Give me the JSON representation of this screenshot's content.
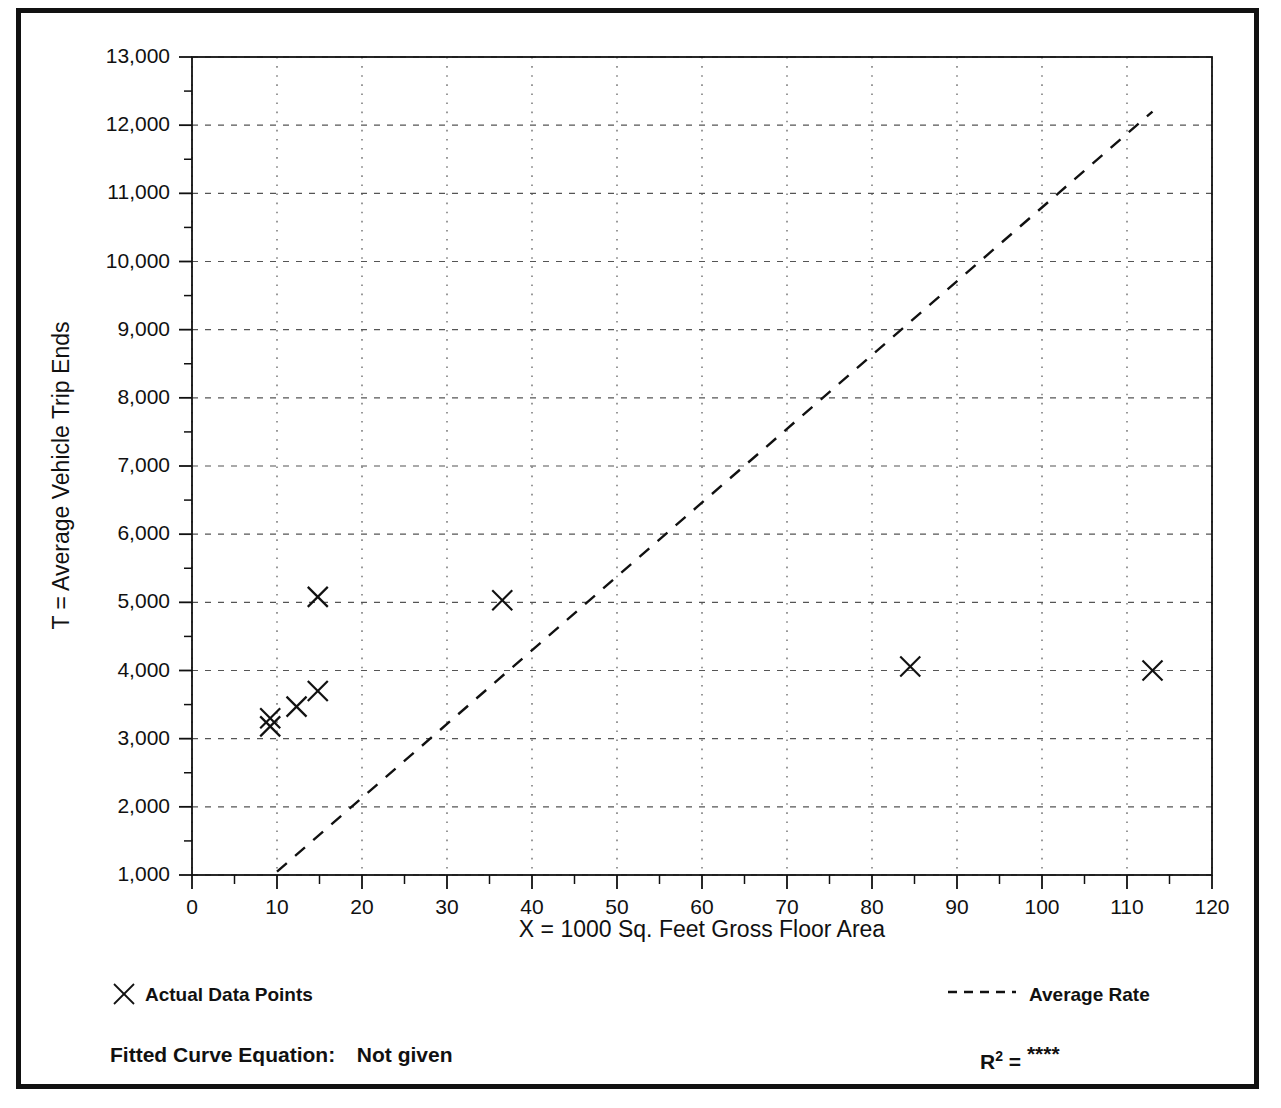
{
  "chart_data": {
    "type": "scatter",
    "title": "",
    "xlabel": "X = 1000 Sq. Feet Gross Floor Area",
    "ylabel": "T = Average Vehicle Trip Ends",
    "xlim": [
      0,
      120
    ],
    "ylim": [
      1000,
      13000
    ],
    "xticks": [
      0,
      10,
      20,
      30,
      40,
      50,
      60,
      70,
      80,
      90,
      100,
      110,
      120
    ],
    "xtick_labels": [
      "0",
      "10",
      "20",
      "30",
      "40",
      "50",
      "60",
      "70",
      "80",
      "90",
      "100",
      "110",
      "120"
    ],
    "xminor_step": 5,
    "yticks": [
      1000,
      2000,
      3000,
      4000,
      5000,
      6000,
      7000,
      8000,
      9000,
      10000,
      11000,
      12000,
      13000
    ],
    "ytick_labels": [
      "1,000",
      "2,000",
      "3,000",
      "4,000",
      "5,000",
      "6,000",
      "7,000",
      "8,000",
      "9,000",
      "10,000",
      "11,000",
      "12,000",
      "13,000"
    ],
    "yminor_step": 500,
    "grid": true,
    "grid_style": "dotted",
    "grid_color": "#555555",
    "legend_position": "below-axes",
    "series": [
      {
        "name": "Actual Data Points",
        "type": "scatter",
        "marker": "x",
        "color": "#111111",
        "points": [
          {
            "x": 9.2,
            "y": 3300
          },
          {
            "x": 9.2,
            "y": 3180
          },
          {
            "x": 12.3,
            "y": 3470
          },
          {
            "x": 14.8,
            "y": 3700
          },
          {
            "x": 14.8,
            "y": 5080
          },
          {
            "x": 36.5,
            "y": 5030
          },
          {
            "x": 84.5,
            "y": 4060
          },
          {
            "x": 113.0,
            "y": 4000
          }
        ]
      },
      {
        "name": "Average Rate",
        "type": "line",
        "style": "dashed",
        "color": "#111111",
        "x": [
          10.0,
          113.0
        ],
        "y": [
          1050,
          12200
        ]
      }
    ]
  },
  "legend": {
    "points_label": "Actual Data Points",
    "line_label": "Average Rate",
    "points_marker_icon": "x-marker-icon",
    "line_marker_icon": "dashed-line-icon"
  },
  "annotations": {
    "fitted_curve_label": "Fitted Curve Equation:",
    "fitted_curve_value": "Not given",
    "r2_label": "R",
    "r2_exponent": "2",
    "r2_equals": "=",
    "r2_value": "****"
  },
  "style": {
    "background": "#ffffff",
    "frame_color": "#111111",
    "axis_color": "#111111",
    "text_color": "#111111"
  }
}
